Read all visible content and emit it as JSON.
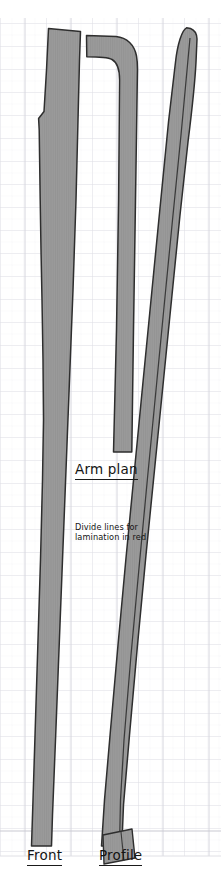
{
  "sheet": {
    "width": 221,
    "height": 875,
    "background_color": "#ffffff",
    "title": "Bow limb lamination layout"
  },
  "grid": {
    "minor_spacing_px": 11.5,
    "major_spacing_px": 23,
    "minor_color": "#f0f0f2",
    "major_color": "#dcdce2",
    "vertical_major_color": "#d5d5dd",
    "baseline_color": "#c8c8d0",
    "visible": true
  },
  "style": {
    "fill_color": "#9a9a9a",
    "outline_color": "#2e2e2e",
    "divide_line_color": "#3a3a3a",
    "text_color": "#141414",
    "hatch_color": "#8e8e8e"
  },
  "labels": {
    "arm_plan": "Arm plan",
    "divide_note": "Divide lines for lamination in red",
    "divide_note_line1": "Divide lines for",
    "divide_note_line2": "lamination in",
    "divide_note_line3": "red",
    "front": "Front",
    "profile": "Profile"
  },
  "parts": [
    {
      "id": "front-limb",
      "name": "Front",
      "label": "Front",
      "description": "Front elevation of bow limb: wide tapered stave with stepped notch on the left edge near the top",
      "outline_points": "48,28 80,31 79,55 78,120 76,200 72,300 68,400 64,500 60,600 56,700 52,790 50,846 31,846 33,790 36,700 39,600 42,500 44,420 43,360 42,300 41,250 40,200 40,160 39,130 38,118 43,112 46,70",
      "divide_lines": []
    },
    {
      "id": "arm-plan",
      "name": "Arm plan",
      "label": "Arm plan",
      "description": "Plan view of the arm/limb with a curved hook at the top, tapering downward",
      "outline_points": "88,36 118,38 128,45 134,56 136,70 136,450 118,450 118,75 115,63 106,58 88,57",
      "divide_lines": []
    },
    {
      "id": "profile-limb",
      "name": "Profile",
      "label": "Profile",
      "description": "Side profile of bow limb: narrow slanted stave leaning right with a rounded tip and an internal lamination divide line",
      "outline_points": "192,28 196,33 197,60 194,110 188,180 180,260 172,340 164,420 156,500 148,580 140,660 132,740 125,800 122,846 101,846 106,800 114,730 122,650 130,560 138,470 146,380 154,290 162,200 170,120 178,60 185,34",
      "divide_lines": [
        "189,40 181,140 172,250 163,360 154,470 145,580 136,690 128,780 126,846"
      ]
    },
    {
      "id": "profile-foot",
      "name": "Profile foot block",
      "label": "",
      "description": "Small slanted block at the bottom of the profile view",
      "outline_points": "",
      "divide_lines": []
    }
  ],
  "annotations": [
    {
      "name": "arm-plan-label",
      "text": "Arm plan",
      "underlined": true,
      "x": 75,
      "y": 462
    },
    {
      "name": "divide-lines-note",
      "text": "Divide lines for lamination in red",
      "underlined": false,
      "x": 75,
      "y": 523
    },
    {
      "name": "front-label",
      "text": "Front",
      "underlined": true,
      "x": 27,
      "y": 848
    },
    {
      "name": "profile-label",
      "text": "Profile",
      "underlined": true,
      "x": 99,
      "y": 848
    }
  ]
}
